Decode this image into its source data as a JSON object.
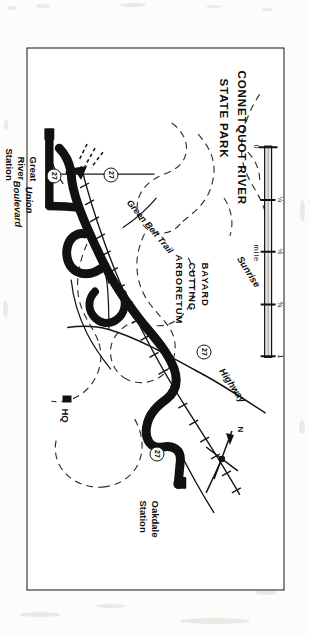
{
  "document": {
    "kind": "scanned-map-page",
    "orientation_note": "map printed sideways (rotated 90 degrees) on the page"
  },
  "map": {
    "park_label": {
      "line1": "CONNETQUOT  RIVER",
      "line2": "STATE  PARK"
    },
    "arboretum_label": {
      "line1": "BAYARD",
      "line2": "CUTTING",
      "line3": "ARBORETUM"
    },
    "stations": [
      {
        "name": "oakdale-station",
        "line1": "Oakdale",
        "line2": "Station"
      },
      {
        "name": "great-river-station",
        "line1": "Great",
        "line2": "River",
        "line3": "Station"
      }
    ],
    "roads": [
      {
        "name": "sunrise-highway-word-sunrise",
        "label": "Sunrise"
      },
      {
        "name": "sunrise-highway-word-highway",
        "label": "Highway"
      },
      {
        "name": "union-boulevard-line1",
        "label": "Union"
      },
      {
        "name": "union-boulevard-line2",
        "label": "Boulevard"
      }
    ],
    "trail": {
      "label": "Green Belt Trail"
    },
    "headquarters": {
      "label": "HQ"
    },
    "route_shields": [
      {
        "name": "route-shield-sunrise-north",
        "number": "27"
      },
      {
        "name": "route-shield-oakdale",
        "number": "27"
      },
      {
        "name": "route-shield-west",
        "number": "27"
      },
      {
        "name": "route-shield-south",
        "number": "27"
      }
    ],
    "north_arrow": {
      "label": "N"
    },
    "scale_bar": {
      "unit_label": "mile",
      "ticks": [
        "0",
        "¼",
        "½",
        "¾",
        "1"
      ]
    }
  },
  "colors": {
    "ink": "#111111",
    "paper": "#ffffff",
    "page": "#fcfcfb",
    "dashed": "#3a3a3a"
  }
}
